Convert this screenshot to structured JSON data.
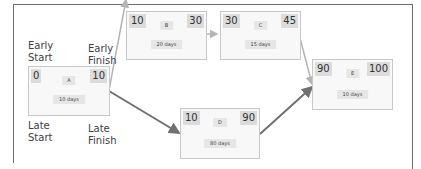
{
  "labels": {
    "early_start": [
      "Early",
      "Start"
    ],
    "early_finish": [
      "Early",
      "Finish"
    ],
    "late_start": [
      "Late",
      "Start"
    ],
    "late_finish": [
      "Late",
      "Finish"
    ]
  },
  "nodes": {
    "A": {
      "name": "A",
      "es": "0",
      "ef": "10",
      "duration": "10 days"
    },
    "B": {
      "name": "B",
      "es": "10",
      "ef": "30",
      "duration": "20 days"
    },
    "C": {
      "name": "C",
      "es": "30",
      "ef": "45",
      "duration": "15 days"
    },
    "D": {
      "name": "D",
      "es": "10",
      "ef": "90",
      "duration": "80 days"
    },
    "E": {
      "name": "E",
      "es": "90",
      "ef": "100",
      "duration": "10 days"
    }
  },
  "edges": [
    {
      "from": "A",
      "to": "B",
      "critical": false
    },
    {
      "from": "B",
      "to": "C",
      "critical": false
    },
    {
      "from": "C",
      "to": "E",
      "critical": false
    },
    {
      "from": "A",
      "to": "D",
      "critical": true
    },
    {
      "from": "D",
      "to": "E",
      "critical": true
    }
  ],
  "colors": {
    "critical_arrow": "#707070",
    "normal_arrow": "#b4b4b4",
    "frame": "#6e6e6e"
  }
}
